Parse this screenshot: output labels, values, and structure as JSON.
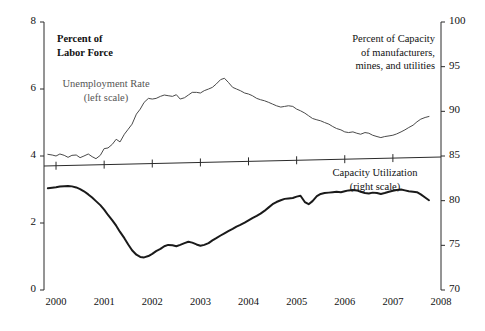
{
  "chart_data": {
    "type": "line",
    "title": "",
    "subtitle": "",
    "xlabel": "",
    "ylabel": "Percent of Labor Force",
    "ylabel_right": "Percent of Capacity of manufacturers, mines, and utilities",
    "grid": false,
    "legend_position": "inline-annotations",
    "x_ticks": [
      "2000",
      "2001",
      "2002",
      "2003",
      "2004",
      "2005",
      "2006",
      "2007",
      "2008"
    ],
    "x_range": [
      1999.75,
      2008.0
    ],
    "left_axis": {
      "label": "Percent of Labor Force",
      "ticks": [
        "8",
        "6",
        "4",
        "2",
        "0"
      ],
      "tick_values": [
        8,
        6,
        4,
        2,
        0
      ],
      "ylim": [
        0,
        8
      ]
    },
    "right_axis": {
      "label": "Percent of Capacity of manufacturers, mines, and utilities",
      "ticks": [
        "100",
        "95",
        "90",
        "85",
        "80",
        "75",
        "70"
      ],
      "tick_values": [
        100,
        95,
        90,
        85,
        80,
        75,
        70
      ],
      "ylim": [
        70,
        100
      ]
    },
    "series": [
      {
        "name": "Unemployment Rate",
        "axis": "left",
        "annotation": "Unemployment Rate (left scale)",
        "color": "#4a4a4a",
        "x": [
          1999.83,
          1999.92,
          2000.0,
          2000.08,
          2000.17,
          2000.25,
          2000.33,
          2000.42,
          2000.5,
          2000.58,
          2000.67,
          2000.75,
          2000.83,
          2000.92,
          2001.0,
          2001.08,
          2001.17,
          2001.25,
          2001.33,
          2001.42,
          2001.5,
          2001.58,
          2001.67,
          2001.75,
          2001.83,
          2001.92,
          2002.0,
          2002.08,
          2002.17,
          2002.25,
          2002.33,
          2002.42,
          2002.5,
          2002.58,
          2002.67,
          2002.75,
          2002.83,
          2002.92,
          2003.0,
          2003.08,
          2003.17,
          2003.25,
          2003.33,
          2003.42,
          2003.5,
          2003.58,
          2003.67,
          2003.75,
          2003.83,
          2003.92,
          2004.0,
          2004.08,
          2004.17,
          2004.25,
          2004.33,
          2004.42,
          2004.5,
          2004.58,
          2004.67,
          2004.75,
          2004.83,
          2004.92,
          2005.0,
          2005.08,
          2005.17,
          2005.25,
          2005.33,
          2005.42,
          2005.5,
          2005.58,
          2005.67,
          2005.75,
          2005.83,
          2005.92,
          2006.0,
          2006.08,
          2006.17,
          2006.25,
          2006.33,
          2006.42,
          2006.5,
          2006.58,
          2006.67,
          2006.75,
          2006.83,
          2006.92,
          2007.0,
          2007.08,
          2007.17,
          2007.25,
          2007.33,
          2007.42,
          2007.5,
          2007.58,
          2007.67,
          2007.75
        ],
        "values": [
          4.05,
          4.03,
          4.0,
          4.06,
          4.02,
          3.96,
          4.02,
          4.03,
          3.95,
          4.0,
          4.06,
          3.98,
          3.92,
          4.02,
          4.22,
          4.24,
          4.35,
          4.5,
          4.42,
          4.65,
          4.8,
          4.95,
          5.25,
          5.4,
          5.6,
          5.72,
          5.7,
          5.72,
          5.78,
          5.82,
          5.8,
          5.78,
          5.83,
          5.7,
          5.74,
          5.82,
          5.9,
          5.9,
          5.88,
          5.95,
          6.0,
          6.05,
          6.15,
          6.28,
          6.32,
          6.2,
          6.05,
          6.0,
          5.95,
          5.88,
          5.85,
          5.8,
          5.72,
          5.68,
          5.65,
          5.6,
          5.55,
          5.5,
          5.46,
          5.48,
          5.5,
          5.48,
          5.4,
          5.35,
          5.28,
          5.2,
          5.12,
          5.08,
          5.05,
          5.0,
          4.95,
          4.88,
          4.82,
          4.78,
          4.72,
          4.7,
          4.72,
          4.68,
          4.65,
          4.7,
          4.68,
          4.62,
          4.58,
          4.55,
          4.58,
          4.6,
          4.62,
          4.66,
          4.72,
          4.78,
          4.85,
          4.92,
          5.02,
          5.1,
          5.15,
          5.18
        ]
      },
      {
        "name": "Capacity Utilization",
        "axis": "right",
        "annotation": "Capacity Utilization (right scale)",
        "color": "#1a1a1a",
        "x": [
          1999.83,
          1999.92,
          2000.0,
          2000.08,
          2000.17,
          2000.25,
          2000.33,
          2000.42,
          2000.5,
          2000.58,
          2000.67,
          2000.75,
          2000.83,
          2000.92,
          2001.0,
          2001.08,
          2001.17,
          2001.25,
          2001.33,
          2001.42,
          2001.5,
          2001.58,
          2001.67,
          2001.75,
          2001.83,
          2001.92,
          2002.0,
          2002.08,
          2002.17,
          2002.25,
          2002.33,
          2002.42,
          2002.5,
          2002.58,
          2002.67,
          2002.75,
          2002.83,
          2002.92,
          2003.0,
          2003.08,
          2003.17,
          2003.25,
          2003.33,
          2003.42,
          2003.5,
          2003.58,
          2003.67,
          2003.75,
          2003.83,
          2003.92,
          2004.0,
          2004.08,
          2004.17,
          2004.25,
          2004.33,
          2004.42,
          2004.5,
          2004.58,
          2004.67,
          2004.75,
          2004.83,
          2004.92,
          2005.0,
          2005.08,
          2005.17,
          2005.25,
          2005.33,
          2005.42,
          2005.5,
          2005.58,
          2005.67,
          2005.75,
          2005.83,
          2005.92,
          2006.0,
          2006.08,
          2006.17,
          2006.25,
          2006.33,
          2006.42,
          2006.5,
          2006.58,
          2006.67,
          2006.75,
          2006.83,
          2006.92,
          2007.0,
          2007.08,
          2007.17,
          2007.25,
          2007.33,
          2007.42,
          2007.5,
          2007.58,
          2007.67,
          2007.75
        ],
        "values": [
          81.4,
          81.45,
          81.5,
          81.58,
          81.62,
          81.65,
          81.6,
          81.48,
          81.3,
          81.05,
          80.7,
          80.35,
          79.95,
          79.5,
          79.0,
          78.4,
          77.8,
          77.2,
          76.5,
          75.8,
          75.1,
          74.45,
          73.95,
          73.7,
          73.65,
          73.8,
          74.05,
          74.35,
          74.6,
          74.9,
          75.05,
          75.0,
          74.9,
          75.05,
          75.25,
          75.4,
          75.3,
          75.1,
          74.95,
          75.05,
          75.25,
          75.55,
          75.8,
          76.1,
          76.35,
          76.6,
          76.85,
          77.1,
          77.3,
          77.55,
          77.8,
          78.05,
          78.3,
          78.55,
          78.85,
          79.25,
          79.6,
          79.85,
          80.05,
          80.2,
          80.25,
          80.3,
          80.45,
          80.55,
          79.85,
          79.6,
          79.95,
          80.5,
          80.75,
          80.85,
          80.9,
          80.95,
          81.0,
          80.95,
          81.05,
          81.15,
          81.2,
          81.15,
          81.0,
          80.85,
          80.8,
          80.9,
          80.85,
          80.75,
          80.85,
          81.0,
          81.1,
          81.2,
          81.25,
          81.15,
          81.05,
          81.0,
          80.95,
          80.7,
          80.35,
          80.05
        ]
      }
    ],
    "annotations": [
      {
        "id": "left-axis-title",
        "text_line1": "Percent of",
        "text_line2": "Labor Force"
      },
      {
        "id": "right-axis-title",
        "text_line1": "Percent of Capacity",
        "text_line2": "of manufacturers,",
        "text_line3": "mines, and utilities"
      },
      {
        "id": "unemployment-label",
        "text_line1": "Unemployment Rate",
        "text_line2": "(left  scale)"
      },
      {
        "id": "capacity-label",
        "text_line1": "Capacity Utilization",
        "text_line2": "(right scale)"
      }
    ]
  },
  "left_axis_title": {
    "line1": "Percent of",
    "line2": "Labor Force"
  },
  "right_axis_title": {
    "line1": "Percent of Capacity",
    "line2": "of manufacturers,",
    "line3": "mines, and utilities"
  },
  "unemployment_label": {
    "line1": "Unemployment Rate",
    "line2": "(left  scale)"
  },
  "capacity_label": {
    "line1": "Capacity Utilization",
    "line2": "(right scale)"
  },
  "y_left_ticks": [
    "8",
    "6",
    "4",
    "2",
    "0"
  ],
  "y_right_ticks": [
    "100",
    "95",
    "90",
    "85",
    "80",
    "75",
    "70"
  ],
  "x_ticks": [
    "2000",
    "2001",
    "2002",
    "2003",
    "2004",
    "2005",
    "2006",
    "2007",
    "2008"
  ]
}
